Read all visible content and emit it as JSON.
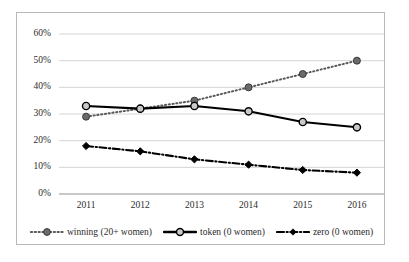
{
  "chart_data": {
    "type": "line",
    "title": "",
    "subtitle": "",
    "xlabel": "",
    "ylabel": "",
    "categories": [
      "2011",
      "2012",
      "2013",
      "2014",
      "2015",
      "2016"
    ],
    "ylim": [
      0,
      60
    ],
    "ytick_values": [
      0,
      10,
      20,
      30,
      40,
      50,
      60
    ],
    "ytick_labels": [
      "0%",
      "10%",
      "20%",
      "30%",
      "40%",
      "50%",
      "60%"
    ],
    "grid": "horizontal",
    "legend_position": "bottom",
    "series": [
      {
        "name": "winning (20+ women)",
        "values": [
          29,
          32,
          35,
          40,
          45,
          50
        ],
        "line_style": "dotted",
        "marker": "circle-filled",
        "color": "#595959"
      },
      {
        "name": "token (0 women)",
        "values": [
          33,
          32,
          33,
          31,
          27,
          25
        ],
        "line_style": "solid",
        "marker": "circle-open",
        "color": "#000000"
      },
      {
        "name": "zero (0 women)",
        "values": [
          18,
          16,
          13,
          11,
          9,
          8
        ],
        "line_style": "dash-dot",
        "marker": "diamond-filled",
        "color": "#000000"
      }
    ]
  },
  "legend": {
    "items": [
      {
        "label": "winning (20+ women)"
      },
      {
        "label": "token (0 women)"
      },
      {
        "label": "zero (0 women)"
      }
    ]
  },
  "axes": {
    "y_labels": [
      "60%",
      "50%",
      "40%",
      "30%",
      "20%",
      "10%",
      "0%"
    ],
    "x_labels": [
      "2011",
      "2012",
      "2013",
      "2014",
      "2015",
      "2016"
    ]
  }
}
